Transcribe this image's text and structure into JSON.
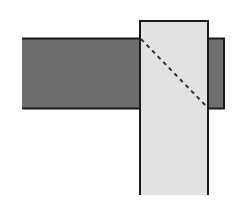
{
  "diagram": {
    "colors": {
      "background": "#ffffff",
      "horizontal_member_fill": "#6e6e6e",
      "vertical_member_fill": "#e2e2e2",
      "stroke": "#1a1a1a",
      "dashed_line": "#333333"
    },
    "horizontal_member": {
      "x": 22,
      "y": 38,
      "width": 202,
      "height": 71
    },
    "vertical_member": {
      "x": 140,
      "y": 21,
      "width": 68,
      "height": 174
    },
    "dashed_line": {
      "x1": 141,
      "y1": 39,
      "x2": 207,
      "y2": 107
    }
  }
}
